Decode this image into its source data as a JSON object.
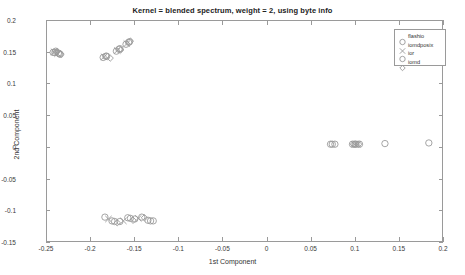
{
  "chart_data": {
    "type": "scatter",
    "title": "Kernel = blended spectrum, weight = 2, using byte info",
    "xlabel": "1st Component",
    "ylabel": "2nd Component",
    "xlim": [
      -0.25,
      0.2
    ],
    "ylim": [
      -0.15,
      0.2
    ],
    "xticks": [
      -0.25,
      -0.2,
      -0.15,
      -0.1,
      -0.05,
      0,
      0.05,
      0.1,
      0.15,
      0.2
    ],
    "yticks": [
      -0.15,
      -0.1,
      -0.05,
      0,
      0.05,
      0.1,
      0.15,
      0.2
    ],
    "xticklabels": [
      "-0.25",
      "-0.2",
      "-0.15",
      "-0.1",
      "-0.05",
      "0",
      "0.05",
      "0.1",
      "0.15",
      "0.2"
    ],
    "yticklabels": [
      "-0.15",
      "-0.1",
      "-0.05",
      "0",
      "0.05",
      "0.1",
      "0.15",
      "0.2"
    ],
    "grid": false,
    "legend_position": "top-right",
    "marker_color": "#9a9a9a",
    "series": [
      {
        "name": "flashio",
        "marker": "circle",
        "points": [
          [
            -0.243,
            0.15
          ],
          [
            -0.24,
            0.152
          ],
          [
            -0.237,
            0.149
          ],
          [
            -0.235,
            0.147
          ],
          [
            -0.186,
            0.142
          ],
          [
            -0.183,
            0.144
          ],
          [
            -0.171,
            0.152
          ],
          [
            -0.168,
            0.155
          ],
          [
            -0.16,
            0.163
          ],
          [
            -0.157,
            0.166
          ],
          [
            -0.184,
            -0.112
          ],
          [
            -0.176,
            -0.118
          ],
          [
            -0.167,
            -0.119
          ],
          [
            -0.158,
            -0.113
          ],
          [
            -0.15,
            -0.115
          ],
          [
            -0.142,
            -0.112
          ],
          [
            -0.135,
            -0.117
          ],
          [
            -0.129,
            -0.118
          ],
          [
            0.073,
            0.004
          ],
          [
            0.078,
            0.004
          ],
          [
            0.098,
            0.004
          ],
          [
            0.102,
            0.004
          ],
          [
            0.106,
            0.004
          ],
          [
            0.135,
            0.005
          ],
          [
            0.185,
            0.006
          ]
        ]
      },
      {
        "name": "iomdposix",
        "marker": "x-cross",
        "points": [
          [
            -0.242,
            0.151
          ],
          [
            -0.238,
            0.148
          ],
          [
            -0.185,
            0.143
          ],
          [
            -0.17,
            0.153
          ],
          [
            -0.159,
            0.164
          ],
          [
            -0.18,
            -0.115
          ],
          [
            -0.163,
            -0.118
          ],
          [
            -0.146,
            -0.114
          ],
          [
            0.1,
            0.004
          ],
          [
            0.104,
            0.004
          ]
        ]
      },
      {
        "name": "ior",
        "marker": "circle",
        "points": [
          [
            -0.241,
            0.15
          ],
          [
            -0.236,
            0.148
          ],
          [
            -0.182,
            0.144
          ],
          [
            -0.167,
            0.156
          ],
          [
            -0.156,
            0.167
          ],
          [
            -0.173,
            -0.119
          ],
          [
            -0.155,
            -0.114
          ],
          [
            -0.132,
            -0.118
          ],
          [
            0.075,
            0.004
          ],
          [
            0.101,
            0.004
          ]
        ]
      },
      {
        "name": "iomd",
        "marker": "diamond",
        "points": [
          [
            -0.239,
            0.151
          ],
          [
            -0.234,
            0.147
          ],
          [
            -0.178,
            0.141
          ],
          [
            -0.166,
            0.154
          ],
          [
            -0.155,
            0.168
          ],
          [
            -0.17,
            -0.121
          ],
          [
            -0.152,
            -0.117
          ],
          [
            -0.139,
            -0.113
          ],
          [
            0.099,
            0.004
          ],
          [
            0.105,
            0.004
          ]
        ]
      }
    ]
  },
  "legend": {
    "entries": [
      {
        "label": "flashio",
        "marker": "circle"
      },
      {
        "label": "iomdposix",
        "marker": "x-cross"
      },
      {
        "label": "ior",
        "marker": "circle"
      },
      {
        "label": "iomd",
        "marker": "diamond"
      }
    ]
  }
}
